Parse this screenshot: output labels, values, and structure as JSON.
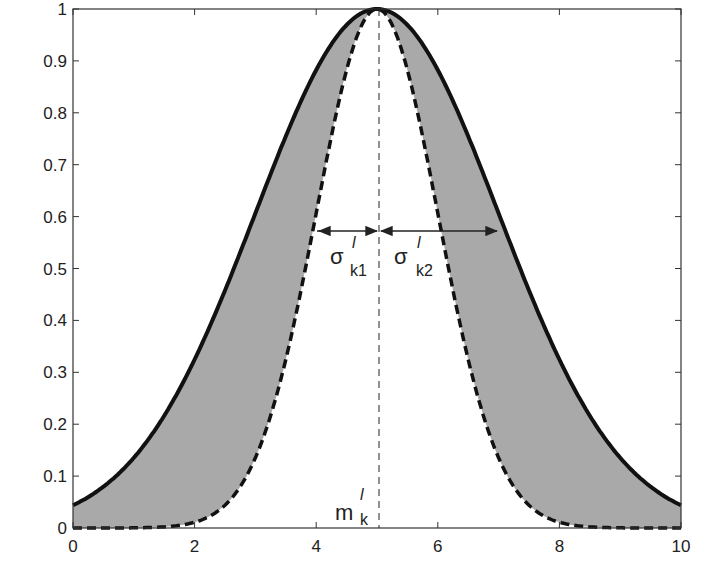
{
  "chart_data": {
    "type": "area",
    "title": "",
    "xlabel": "",
    "ylabel": "",
    "xlim": [
      0,
      10
    ],
    "ylim": [
      0,
      1
    ],
    "grid": false,
    "legend": null,
    "x_ticks": [
      "0",
      "2",
      "4",
      "6",
      "8",
      "10"
    ],
    "y_ticks": [
      "0",
      "0.1",
      "0.2",
      "0.3",
      "0.4",
      "0.5",
      "0.6",
      "0.7",
      "0.8",
      "0.9",
      "1"
    ],
    "series": [
      {
        "name": "upper membership function",
        "style": "solid",
        "center": 5,
        "sigma": 2,
        "x": [
          0,
          1,
          2,
          3,
          4,
          5,
          6,
          7,
          8,
          9,
          10
        ],
        "values": [
          0.044,
          0.135,
          0.325,
          0.607,
          0.882,
          1.0,
          0.882,
          0.607,
          0.325,
          0.135,
          0.044
        ]
      },
      {
        "name": "lower membership function",
        "style": "dashed",
        "center": 5,
        "sigma": 1,
        "x": [
          0,
          1,
          2,
          3,
          4,
          5,
          6,
          7,
          8,
          9,
          10
        ],
        "values": [
          0.0,
          0.0003,
          0.011,
          0.135,
          0.607,
          1.0,
          0.607,
          0.135,
          0.011,
          0.0003,
          0.0
        ]
      }
    ],
    "shaded_region": "footprint of uncertainty between upper and lower curves",
    "annotations": [
      {
        "text": "σ",
        "sup": "l",
        "sub": "k1",
        "x": 4.5,
        "y": 0.55,
        "arrow_from": 4,
        "arrow_to": 5,
        "arrow_y": 0.61
      },
      {
        "text": "σ",
        "sup": "l",
        "sub": "k2",
        "x": 5.6,
        "y": 0.55,
        "arrow_from": 5,
        "arrow_to": 7,
        "arrow_y": 0.61
      },
      {
        "text": "m",
        "sup": "l",
        "sub": "k",
        "x": 4.6,
        "y": 0.05
      },
      {
        "vline_x": 5,
        "style": "dashed"
      }
    ]
  },
  "labels": {
    "sigma1": {
      "base": "σ",
      "sup": "l",
      "sub": "k1"
    },
    "sigma2": {
      "base": "σ",
      "sup": "l",
      "sub": "k2"
    },
    "mean": {
      "base": "m",
      "sup": "l",
      "sub": "k"
    }
  }
}
